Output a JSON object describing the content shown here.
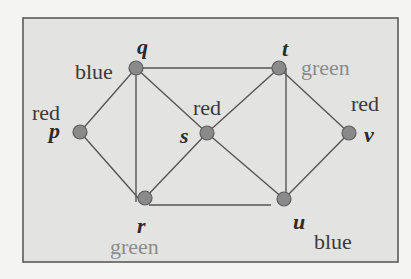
{
  "diagram": {
    "type": "graph-coloring",
    "frame": {
      "fill": "#e3e3e2",
      "stroke": "#5a5a5a"
    },
    "vertices": [
      {
        "id": "p",
        "color": "red",
        "x": 80,
        "y": 132
      },
      {
        "id": "q",
        "color": "blue",
        "x": 136,
        "y": 68
      },
      {
        "id": "r",
        "color": "green",
        "x": 145,
        "y": 198
      },
      {
        "id": "s",
        "color": "red",
        "x": 207,
        "y": 133
      },
      {
        "id": "t",
        "color": "green",
        "x": 279,
        "y": 68
      },
      {
        "id": "u",
        "color": "blue",
        "x": 284,
        "y": 199
      },
      {
        "id": "v",
        "color": "red",
        "x": 349,
        "y": 133
      }
    ],
    "edges": [
      [
        "q",
        "t"
      ],
      [
        "q",
        "p"
      ],
      [
        "q",
        "r"
      ],
      [
        "q",
        "s"
      ],
      [
        "p",
        "r"
      ],
      [
        "r",
        "s"
      ],
      [
        "r",
        "u"
      ],
      [
        "s",
        "t"
      ],
      [
        "s",
        "u"
      ],
      [
        "t",
        "u"
      ],
      [
        "t",
        "v"
      ],
      [
        "u",
        "v"
      ]
    ]
  },
  "labels": {
    "p": {
      "name": "p",
      "color": "red"
    },
    "q": {
      "name": "q",
      "color": "blue"
    },
    "r": {
      "name": "r",
      "color": "green"
    },
    "s": {
      "name": "s",
      "color": "red"
    },
    "t": {
      "name": "t",
      "color": "green"
    },
    "u": {
      "name": "u",
      "color": "blue"
    },
    "v": {
      "name": "v",
      "color": "red"
    }
  }
}
